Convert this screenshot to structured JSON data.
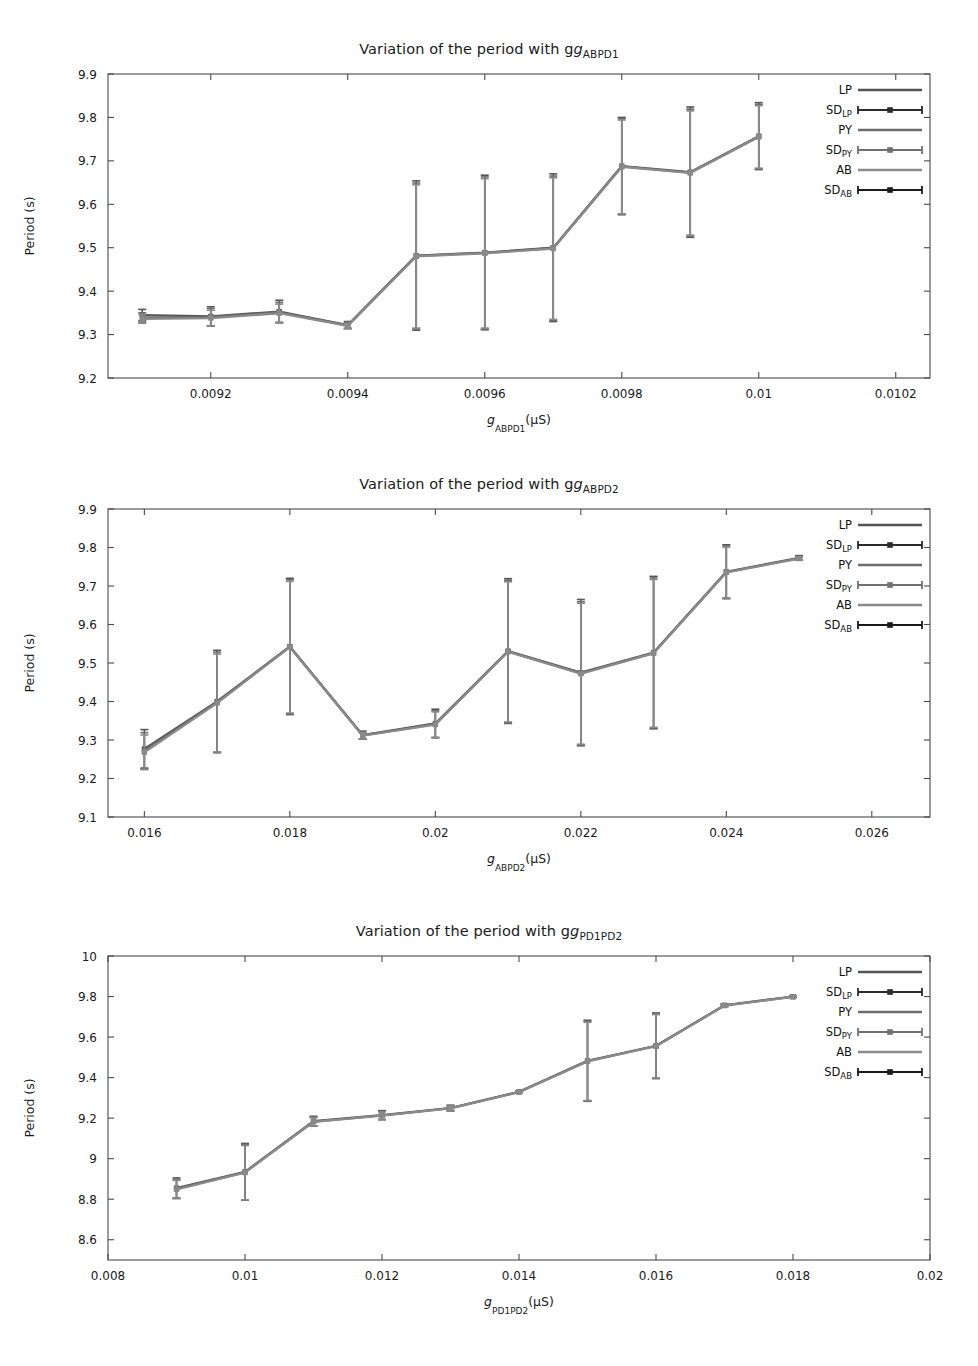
{
  "figure": {
    "background": "#ffffff",
    "axis_color": "#4a4a4a",
    "series_colors": {
      "LP": "#555555",
      "SD_LP": "#2b2b2b",
      "PY": "#6e6e6e",
      "SD_PY": "#707070",
      "AB": "#8a8a8a",
      "SD_AB": "#1a1a1a"
    }
  },
  "legend": {
    "position": "top-right",
    "entries": [
      {
        "label": "LP",
        "sub": "",
        "kind": "line",
        "color": "#555555"
      },
      {
        "label": "SD",
        "sub": "LP",
        "kind": "errbar",
        "color": "#2b2b2b"
      },
      {
        "label": "PY",
        "sub": "",
        "kind": "line",
        "color": "#6e6e6e"
      },
      {
        "label": "SD",
        "sub": "PY",
        "kind": "errbar",
        "color": "#707070"
      },
      {
        "label": "AB",
        "sub": "",
        "kind": "line",
        "color": "#8a8a8a"
      },
      {
        "label": "SD",
        "sub": "AB",
        "kind": "errbar",
        "color": "#1a1a1a"
      }
    ]
  },
  "chart_data": [
    {
      "id": "chart-abpd1",
      "type": "line",
      "title": "Variation of the period with g",
      "title_sub": "ABPD1",
      "xlabel": "g",
      "xlabel_sub": "ABPD1",
      "xlabel_unit": "(µS)",
      "ylabel": "Period (s)",
      "grid": false,
      "xlim": [
        0.00905,
        0.01025
      ],
      "ylim": [
        9.2,
        9.9
      ],
      "xticks": [
        0.0092,
        0.0094,
        0.0096,
        0.0098,
        0.01,
        0.0102
      ],
      "xticklabels": [
        "0.0092",
        "0.0094",
        "0.0096",
        "0.0098",
        "0.01",
        "0.0102"
      ],
      "yticks": [
        9.2,
        9.3,
        9.4,
        9.5,
        9.6,
        9.7,
        9.8,
        9.9
      ],
      "yticklabels": [
        "9.2",
        "9.3",
        "9.4",
        "9.5",
        "9.6",
        "9.7",
        "9.8",
        "9.9"
      ],
      "x": [
        0.0091,
        0.0092,
        0.0093,
        0.0094,
        0.0095,
        0.0096,
        0.0097,
        0.0098,
        0.0099,
        0.01
      ],
      "series": [
        {
          "name": "LP",
          "color": "#555555",
          "values": [
            9.345,
            9.342,
            9.353,
            9.322,
            9.482,
            9.489,
            9.5,
            9.688,
            9.674,
            9.757
          ],
          "err": [
            0.013,
            0.022,
            0.026,
            0.008,
            0.172,
            0.178,
            0.17,
            0.112,
            0.15,
            0.077
          ]
        },
        {
          "name": "PY",
          "color": "#6e6e6e",
          "values": [
            9.339,
            9.34,
            9.351,
            9.321,
            9.481,
            9.488,
            9.499,
            9.687,
            9.673,
            9.756
          ],
          "err": [
            0.011,
            0.02,
            0.023,
            0.007,
            0.168,
            0.175,
            0.166,
            0.11,
            0.146,
            0.074
          ]
        },
        {
          "name": "AB",
          "color": "#8a8a8a",
          "values": [
            9.336,
            9.338,
            9.349,
            9.32,
            9.48,
            9.487,
            9.498,
            9.686,
            9.672,
            9.755
          ],
          "err": [
            0.01,
            0.018,
            0.021,
            0.006,
            0.165,
            0.172,
            0.163,
            0.108,
            0.143,
            0.072
          ]
        }
      ]
    },
    {
      "id": "chart-abpd2",
      "type": "line",
      "title": "Variation of the period with g",
      "title_sub": "ABPD2",
      "xlabel": "g",
      "xlabel_sub": "ABPD2",
      "xlabel_unit": "(µS)",
      "ylabel": "Period (s)",
      "grid": false,
      "xlim": [
        0.0155,
        0.0268
      ],
      "ylim": [
        9.1,
        9.9
      ],
      "xticks": [
        0.016,
        0.018,
        0.02,
        0.022,
        0.024,
        0.026
      ],
      "xticklabels": [
        "0.016",
        "0.018",
        "0.02",
        "0.022",
        "0.024",
        "0.026"
      ],
      "yticks": [
        9.1,
        9.2,
        9.3,
        9.4,
        9.5,
        9.6,
        9.7,
        9.8,
        9.9
      ],
      "yticklabels": [
        "9.1",
        "9.2",
        "9.3",
        "9.4",
        "9.5",
        "9.6",
        "9.7",
        "9.8",
        "9.9"
      ],
      "x": [
        0.016,
        0.017,
        0.018,
        0.019,
        0.02,
        0.021,
        0.022,
        0.023,
        0.024,
        0.025
      ],
      "series": [
        {
          "name": "LP",
          "color": "#555555",
          "values": [
            9.277,
            9.4,
            9.543,
            9.313,
            9.343,
            9.531,
            9.475,
            9.527,
            9.737,
            9.773
          ],
          "err": [
            0.05,
            0.133,
            0.177,
            0.01,
            0.037,
            0.188,
            0.19,
            0.198,
            0.07,
            0.006
          ]
        },
        {
          "name": "PY",
          "color": "#6e6e6e",
          "values": [
            9.272,
            9.398,
            9.542,
            9.312,
            9.341,
            9.53,
            9.473,
            9.526,
            9.736,
            9.772
          ],
          "err": [
            0.047,
            0.13,
            0.174,
            0.009,
            0.035,
            0.185,
            0.186,
            0.195,
            0.068,
            0.005
          ]
        },
        {
          "name": "AB",
          "color": "#8a8a8a",
          "values": [
            9.268,
            9.396,
            9.541,
            9.311,
            9.34,
            9.529,
            9.472,
            9.525,
            9.735,
            9.771
          ],
          "err": [
            0.045,
            0.127,
            0.171,
            0.008,
            0.033,
            0.182,
            0.183,
            0.192,
            0.066,
            0.004
          ]
        }
      ]
    },
    {
      "id": "chart-pd1pd2",
      "type": "line",
      "title": "Variation of the period with g",
      "title_sub": "PD1PD2",
      "xlabel": "g",
      "xlabel_sub": "PD1PD2",
      "xlabel_unit": "(µS)",
      "ylabel": "Period (s)",
      "grid": false,
      "xlim": [
        0.008,
        0.02
      ],
      "ylim": [
        8.5,
        10.0
      ],
      "xticks": [
        0.008,
        0.01,
        0.012,
        0.014,
        0.016,
        0.018,
        0.02
      ],
      "xticklabels": [
        "0.008",
        "0.01",
        "0.012",
        "0.014",
        "0.016",
        "0.018",
        "0.02"
      ],
      "yticks": [
        8.6,
        8.8,
        9.0,
        9.2,
        9.4,
        9.6,
        9.8,
        10.0
      ],
      "yticklabels": [
        "8.6",
        "8.8",
        "9",
        "9.2",
        "9.4",
        "9.6",
        "9.8",
        "10"
      ],
      "x": [
        0.009,
        0.01,
        0.011,
        0.012,
        0.013,
        0.014,
        0.015,
        0.016,
        0.017,
        0.018
      ],
      "series": [
        {
          "name": "LP",
          "color": "#555555",
          "values": [
            8.855,
            8.935,
            9.185,
            9.215,
            9.25,
            9.33,
            9.483,
            9.557,
            9.757,
            9.8
          ],
          "err": [
            0.05,
            0.14,
            0.024,
            0.022,
            0.014,
            0.004,
            0.2,
            0.162,
            0.006,
            0.004
          ]
        },
        {
          "name": "PY",
          "color": "#6e6e6e",
          "values": [
            8.851,
            8.933,
            9.183,
            9.213,
            9.249,
            9.329,
            9.481,
            9.556,
            9.756,
            9.799
          ],
          "err": [
            0.047,
            0.137,
            0.022,
            0.02,
            0.012,
            0.003,
            0.196,
            0.159,
            0.005,
            0.003
          ]
        },
        {
          "name": "AB",
          "color": "#8a8a8a",
          "values": [
            8.848,
            8.931,
            9.182,
            9.212,
            9.248,
            9.328,
            9.48,
            9.555,
            9.755,
            9.798
          ],
          "err": [
            0.045,
            0.134,
            0.02,
            0.019,
            0.011,
            0.003,
            0.193,
            0.156,
            0.004,
            0.003
          ]
        }
      ]
    }
  ]
}
